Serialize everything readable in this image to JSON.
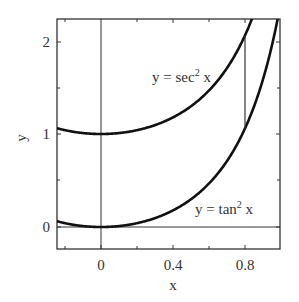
{
  "chart_data": {
    "type": "line",
    "title": "",
    "xlabel": "x",
    "ylabel": "y",
    "xlim": [
      -0.245,
      0.99
    ],
    "ylim": [
      -0.24,
      2.24
    ],
    "grid": false,
    "legend": null,
    "x_ticks": [
      0,
      0.4,
      0.8
    ],
    "x_tick_labels": [
      "0",
      "0.4",
      "0.8"
    ],
    "x_minor_ticks": [
      -0.2,
      0.2,
      0.6
    ],
    "y_ticks": [
      0,
      1,
      2
    ],
    "y_tick_labels": [
      "0",
      "1",
      "2"
    ],
    "y_minor_ticks": [
      0.5,
      1.5
    ],
    "series": [
      {
        "name": "y = sec^2 x",
        "function": "sec^2(x)",
        "x": [
          -0.245,
          -0.2,
          0,
          0.2,
          0.4,
          0.6,
          0.8,
          0.9
        ],
        "values": [
          1.06,
          1.04,
          1.0,
          1.04,
          1.18,
          1.47,
          2.06,
          2.58
        ]
      },
      {
        "name": "y = tan^2 x",
        "function": "tan^2(x)",
        "x": [
          -0.245,
          -0.2,
          0,
          0.2,
          0.4,
          0.6,
          0.8,
          0.95
        ],
        "values": [
          0.06,
          0.04,
          0.0,
          0.04,
          0.18,
          0.47,
          1.06,
          1.98
        ]
      }
    ],
    "reference_lines": [
      {
        "type": "vertical",
        "x": 0,
        "label": "y-axis"
      },
      {
        "type": "horizontal",
        "y": 0,
        "label": "x-axis"
      },
      {
        "type": "segment",
        "x": 0.8,
        "y_from": 1.06,
        "y_to": 2.06,
        "label": "gap of 1 between curves"
      }
    ],
    "annotations": [
      {
        "text": "y = sec² x",
        "near": {
          "x": 0.55,
          "y": 1.65
        }
      },
      {
        "text": "y = tan² x",
        "near": {
          "x": 0.72,
          "y": 0.27
        }
      }
    ]
  },
  "labels": {
    "xlabel": "x",
    "ylabel": "y",
    "xtick0": "0",
    "xtick1": "0.4",
    "xtick2": "0.8",
    "ytick0": "0",
    "ytick1": "1",
    "ytick2": "2",
    "sec_main": "y = sec",
    "sec_sup": "2",
    "sec_tail": " x",
    "tan_main": "y = tan",
    "tan_sup": "2",
    "tan_tail": " x"
  }
}
